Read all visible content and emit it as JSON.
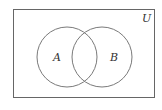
{
  "diagram": {
    "type": "venn",
    "universe_label": "U",
    "sets": [
      {
        "label": "A",
        "cx": 67,
        "cy": 57,
        "r": 30
      },
      {
        "label": "B",
        "cx": 102,
        "cy": 57,
        "r": 30
      }
    ],
    "colors": {
      "stroke": "#7a7a7a",
      "text": "#333333",
      "background": "#ffffff"
    }
  }
}
